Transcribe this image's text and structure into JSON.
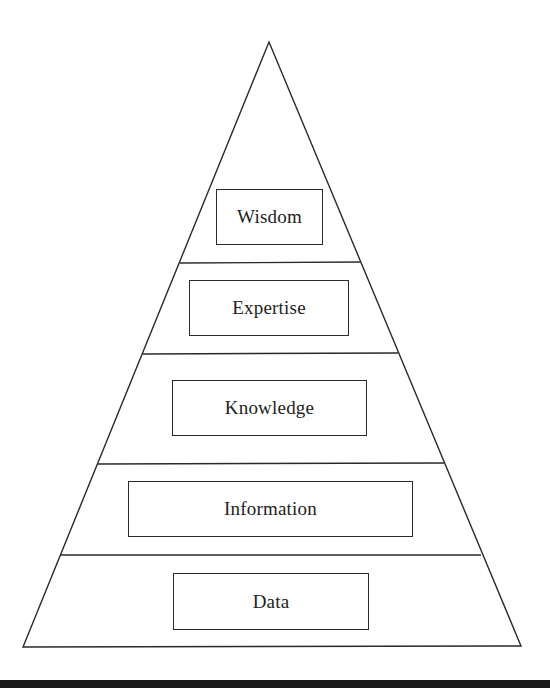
{
  "diagram": {
    "type": "pyramid",
    "title": "",
    "levels_top_to_bottom": [
      {
        "label": "Wisdom"
      },
      {
        "label": "Expertise"
      },
      {
        "label": "Knowledge"
      },
      {
        "label": "Information"
      },
      {
        "label": "Data"
      }
    ],
    "colors": {
      "stroke": "#2a2a2a",
      "text": "#222222",
      "background": "#ffffff",
      "bottom_rule": "#1a1a1a"
    }
  }
}
